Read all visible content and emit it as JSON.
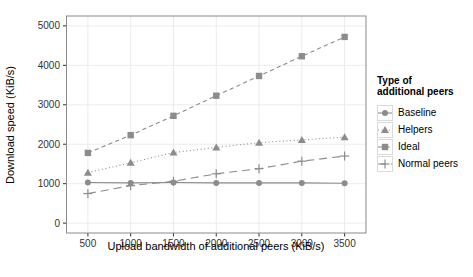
{
  "chart_data": {
    "type": "line",
    "title": "",
    "xlabel": "Upload bandwidth of additional peers (KiB/s)",
    "ylabel": "Download speed (KiB/s)",
    "x": [
      500,
      1000,
      1500,
      2000,
      2500,
      3000,
      3500
    ],
    "x_ticks": [
      500,
      1000,
      1500,
      2000,
      2500,
      3000,
      3500
    ],
    "y_ticks": [
      0,
      1000,
      2000,
      3000,
      4000,
      5000
    ],
    "xlim": [
      250,
      3750
    ],
    "ylim": [
      -250,
      5250
    ],
    "grid": true,
    "legend_position": "right",
    "legend_title_line1": "Type of",
    "legend_title_line2": "additional peers",
    "series": [
      {
        "name": "Baseline",
        "marker": "circle",
        "linestyle": "solid",
        "values": [
          1030,
          1020,
          1030,
          1020,
          1020,
          1020,
          1010
        ]
      },
      {
        "name": "Helpers",
        "marker": "triangle",
        "linestyle": "dotted",
        "values": [
          1280,
          1530,
          1790,
          1920,
          2040,
          2110,
          2180
        ]
      },
      {
        "name": "Ideal",
        "marker": "square",
        "linestyle": "dashed",
        "values": [
          1780,
          2230,
          2720,
          3230,
          3730,
          4230,
          4720
        ]
      },
      {
        "name": "Normal peers",
        "marker": "plus",
        "linestyle": "longdash",
        "values": [
          750,
          950,
          1060,
          1250,
          1380,
          1570,
          1700
        ]
      }
    ],
    "colors": {
      "series": "#8c8c8c",
      "grid": "#ececec",
      "panel_border": "#8a8a8a",
      "panel_bg": "#ffffff",
      "tick_text": "#333333",
      "label_text": "#000000"
    }
  }
}
